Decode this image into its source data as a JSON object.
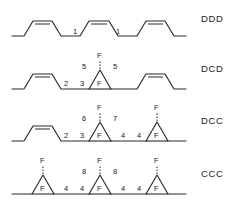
{
  "figure": {
    "type": "chemical-structure-series",
    "background_color": "#ffffff",
    "line_color": "#2a2a2a",
    "text_color": "#202020",
    "width": 239,
    "height": 213,
    "atom_labels": {
      "fluorine": "F"
    }
  },
  "rows": [
    {
      "id": "row-ddd",
      "label": "DDD",
      "label_x": 201,
      "label_y": 13,
      "top": 0,
      "height": 48,
      "description": "triene chain with three cis double bonds",
      "numbers": [
        {
          "text": "1",
          "x": 75,
          "y": 31
        },
        {
          "text": "1",
          "x": 118,
          "y": 31
        }
      ],
      "fluorines": [],
      "rings": 0,
      "alkenes": 3
    },
    {
      "id": "row-dcd",
      "label": "DCD",
      "label_x": 201,
      "label_y": 63,
      "top": 48,
      "height": 53,
      "description": "two cis double bonds flanking one gem-difluoro cyclopropane",
      "numbers": [
        {
          "text": "2",
          "x": 66,
          "y": 83
        },
        {
          "text": "3",
          "x": 82,
          "y": 83
        },
        {
          "text": "5",
          "x": 88,
          "y": 66
        },
        {
          "text": "5",
          "x": 113,
          "y": 66
        }
      ],
      "fluorines": [
        {
          "position": "apex-up",
          "x": 100,
          "y": 41
        },
        {
          "position": "ring-in",
          "x": 100,
          "y": 64
        }
      ],
      "rings": 1,
      "alkenes": 2
    },
    {
      "id": "row-dcc",
      "label": "DCC",
      "label_x": 201,
      "label_y": 115,
      "top": 100,
      "height": 53,
      "description": "one cis double bond and two gem-difluoro cyclopropanes",
      "numbers": [
        {
          "text": "2",
          "x": 66,
          "y": 135
        },
        {
          "text": "3",
          "x": 82,
          "y": 135
        },
        {
          "text": "6",
          "x": 88,
          "y": 118
        },
        {
          "text": "7",
          "x": 113,
          "y": 118
        },
        {
          "text": "4",
          "x": 123,
          "y": 135
        },
        {
          "text": "4",
          "x": 139,
          "y": 135
        }
      ],
      "fluorines": [
        {
          "position": "apex-up",
          "x": 100,
          "y": 93
        },
        {
          "position": "ring-in",
          "x": 100,
          "y": 116
        },
        {
          "position": "apex-up",
          "x": 157,
          "y": 93
        },
        {
          "position": "ring-in",
          "x": 157,
          "y": 116
        }
      ],
      "rings": 2,
      "alkenes": 1
    },
    {
      "id": "row-ccc",
      "label": "CCC",
      "label_x": 201,
      "label_y": 168,
      "top": 153,
      "height": 57,
      "description": "three gem-difluoro cyclopropanes",
      "numbers": [
        {
          "text": "4",
          "x": 66,
          "y": 188
        },
        {
          "text": "4",
          "x": 82,
          "y": 188
        },
        {
          "text": "8",
          "x": 88,
          "y": 171
        },
        {
          "text": "8",
          "x": 113,
          "y": 171
        },
        {
          "text": "4",
          "x": 123,
          "y": 188
        },
        {
          "text": "4",
          "x": 139,
          "y": 188
        }
      ],
      "fluorines": [
        {
          "position": "apex-up",
          "x": 43,
          "y": 146
        },
        {
          "position": "ring-in",
          "x": 43,
          "y": 169
        },
        {
          "position": "apex-up",
          "x": 100,
          "y": 146
        },
        {
          "position": "ring-in",
          "x": 100,
          "y": 169
        },
        {
          "position": "apex-up",
          "x": 157,
          "y": 146
        },
        {
          "position": "ring-in",
          "x": 157,
          "y": 169
        }
      ],
      "rings": 3,
      "alkenes": 0
    }
  ]
}
